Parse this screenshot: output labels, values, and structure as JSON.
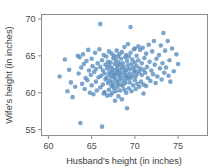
{
  "chart_data": {
    "type": "scatter",
    "title": "",
    "xlabel": "Husband's height (in inches)",
    "ylabel": "Wife's height (in inches)",
    "xlim": [
      59.2,
      78.4
    ],
    "ylim": [
      54.2,
      70.6
    ],
    "xticks": [
      60,
      65,
      70,
      75
    ],
    "yticks": [
      55,
      60,
      65,
      70
    ],
    "xticklabels": [
      "60",
      "65",
      "70",
      "75"
    ],
    "yticklabels": [
      "55",
      "60",
      "65",
      "70"
    ],
    "grid": false,
    "legend": null,
    "marker": {
      "color": "#5b8fbe",
      "opacity": 0.8,
      "size": 2.3,
      "shape": "circle"
    },
    "frame_color": "#8d8d8d",
    "background": "#ffffff",
    "n_points": 199,
    "points": [
      [
        61.3,
        62.2
      ],
      [
        61.9,
        64.5
      ],
      [
        62.2,
        60.2
      ],
      [
        62.4,
        63.1
      ],
      [
        62.6,
        61.4
      ],
      [
        62.8,
        59.4
      ],
      [
        63.1,
        60.8
      ],
      [
        63.4,
        65.0
      ],
      [
        63.5,
        62.6
      ],
      [
        63.6,
        64.8
      ],
      [
        63.7,
        55.9
      ],
      [
        63.8,
        63.4
      ],
      [
        63.9,
        61.2
      ],
      [
        64.0,
        65.2
      ],
      [
        64.1,
        63.9
      ],
      [
        64.2,
        60.5
      ],
      [
        64.3,
        62.0
      ],
      [
        64.4,
        64.3
      ],
      [
        64.5,
        61.7
      ],
      [
        64.6,
        65.8
      ],
      [
        64.7,
        63.0
      ],
      [
        64.8,
        60.0
      ],
      [
        64.9,
        62.4
      ],
      [
        65.0,
        64.6
      ],
      [
        65.0,
        61.0
      ],
      [
        65.1,
        63.6
      ],
      [
        65.2,
        59.8
      ],
      [
        65.3,
        62.8
      ],
      [
        65.4,
        65.4
      ],
      [
        65.5,
        61.5
      ],
      [
        65.5,
        63.2
      ],
      [
        65.6,
        60.3
      ],
      [
        65.7,
        64.0
      ],
      [
        65.8,
        62.1
      ],
      [
        65.9,
        65.9
      ],
      [
        66.0,
        69.3
      ],
      [
        66.0,
        63.5
      ],
      [
        66.0,
        60.7
      ],
      [
        66.1,
        62.3
      ],
      [
        66.2,
        55.4
      ],
      [
        66.2,
        64.4
      ],
      [
        66.3,
        61.1
      ],
      [
        66.3,
        63.0
      ],
      [
        66.4,
        59.9
      ],
      [
        66.4,
        65.1
      ],
      [
        66.5,
        62.6
      ],
      [
        66.5,
        60.1
      ],
      [
        66.6,
        63.8
      ],
      [
        66.6,
        61.8
      ],
      [
        66.7,
        64.9
      ],
      [
        66.7,
        62.0
      ],
      [
        66.8,
        59.6
      ],
      [
        66.8,
        63.3
      ],
      [
        66.9,
        61.3
      ],
      [
        66.9,
        64.2
      ],
      [
        67.0,
        62.5
      ],
      [
        67.0,
        60.4
      ],
      [
        67.0,
        63.7
      ],
      [
        67.0,
        65.6
      ],
      [
        67.1,
        61.6
      ],
      [
        67.1,
        62.9
      ],
      [
        67.2,
        59.7
      ],
      [
        67.2,
        64.1
      ],
      [
        67.2,
        62.2
      ],
      [
        67.3,
        60.9
      ],
      [
        67.3,
        63.4
      ],
      [
        67.3,
        65.3
      ],
      [
        67.4,
        61.4
      ],
      [
        67.4,
        62.7
      ],
      [
        67.4,
        60.0
      ],
      [
        67.5,
        64.7
      ],
      [
        67.5,
        62.1
      ],
      [
        67.5,
        63.1
      ],
      [
        67.5,
        61.0
      ],
      [
        67.6,
        65.0
      ],
      [
        67.6,
        62.4
      ],
      [
        67.6,
        60.6
      ],
      [
        67.7,
        63.9
      ],
      [
        67.7,
        61.9
      ],
      [
        67.7,
        58.9
      ],
      [
        67.8,
        62.6
      ],
      [
        67.8,
        64.4
      ],
      [
        67.8,
        60.2
      ],
      [
        67.9,
        63.2
      ],
      [
        67.9,
        61.5
      ],
      [
        67.9,
        65.7
      ],
      [
        68.0,
        62.8
      ],
      [
        68.0,
        60.8
      ],
      [
        68.0,
        63.6
      ],
      [
        68.0,
        64.9
      ],
      [
        68.0,
        61.2
      ],
      [
        68.1,
        62.3
      ],
      [
        68.1,
        59.5
      ],
      [
        68.1,
        64.1
      ],
      [
        68.2,
        63.0
      ],
      [
        68.2,
        61.7
      ],
      [
        68.2,
        65.2
      ],
      [
        68.3,
        62.5
      ],
      [
        68.3,
        60.3
      ],
      [
        68.3,
        63.8
      ],
      [
        68.4,
        61.1
      ],
      [
        68.4,
        64.6
      ],
      [
        68.4,
        62.0
      ],
      [
        68.5,
        63.3
      ],
      [
        68.5,
        59.1
      ],
      [
        68.5,
        65.5
      ],
      [
        68.6,
        62.7
      ],
      [
        68.6,
        60.9
      ],
      [
        68.6,
        64.0
      ],
      [
        68.7,
        61.6
      ],
      [
        68.7,
        63.5
      ],
      [
        68.8,
        62.2
      ],
      [
        68.8,
        66.2
      ],
      [
        68.8,
        60.4
      ],
      [
        68.9,
        64.8
      ],
      [
        68.9,
        62.9
      ],
      [
        68.9,
        61.3
      ],
      [
        69.0,
        63.1
      ],
      [
        69.0,
        65.1
      ],
      [
        69.0,
        60.0
      ],
      [
        69.0,
        62.4
      ],
      [
        69.1,
        64.3
      ],
      [
        69.1,
        61.9
      ],
      [
        69.1,
        57.9
      ],
      [
        69.2,
        63.7
      ],
      [
        69.2,
        62.1
      ],
      [
        69.2,
        66.6
      ],
      [
        69.3,
        60.6
      ],
      [
        69.3,
        64.9
      ],
      [
        69.4,
        62.6
      ],
      [
        69.4,
        63.2
      ],
      [
        69.4,
        61.4
      ],
      [
        69.5,
        65.4
      ],
      [
        69.5,
        62.0
      ],
      [
        69.5,
        68.9
      ],
      [
        69.6,
        63.9
      ],
      [
        69.6,
        60.2
      ],
      [
        69.7,
        64.5
      ],
      [
        69.7,
        62.3
      ],
      [
        69.8,
        61.0
      ],
      [
        69.8,
        63.4
      ],
      [
        69.9,
        65.9
      ],
      [
        69.9,
        62.8
      ],
      [
        70.0,
        64.1
      ],
      [
        70.0,
        61.7
      ],
      [
        70.0,
        63.0
      ],
      [
        70.0,
        66.0
      ],
      [
        70.1,
        62.2
      ],
      [
        70.1,
        60.5
      ],
      [
        70.2,
        65.0
      ],
      [
        70.2,
        63.6
      ],
      [
        70.3,
        61.2
      ],
      [
        70.3,
        62.6
      ],
      [
        70.4,
        66.3
      ],
      [
        70.4,
        64.4
      ],
      [
        70.5,
        62.9
      ],
      [
        70.5,
        60.8
      ],
      [
        70.6,
        63.3
      ],
      [
        70.6,
        65.8
      ],
      [
        70.7,
        61.5
      ],
      [
        70.8,
        62.4
      ],
      [
        70.8,
        64.0
      ],
      [
        70.9,
        66.1
      ],
      [
        71.0,
        63.1
      ],
      [
        71.0,
        61.1
      ],
      [
        71.1,
        64.7
      ],
      [
        71.2,
        62.7
      ],
      [
        71.3,
        65.3
      ],
      [
        71.3,
        60.9
      ],
      [
        71.4,
        63.5
      ],
      [
        71.5,
        62.0
      ],
      [
        71.6,
        66.5
      ],
      [
        71.7,
        64.2
      ],
      [
        71.8,
        61.6
      ],
      [
        71.9,
        63.0
      ],
      [
        72.0,
        65.6
      ],
      [
        72.1,
        62.5
      ],
      [
        72.2,
        67.0
      ],
      [
        72.3,
        63.8
      ],
      [
        72.4,
        61.3
      ],
      [
        72.5,
        64.6
      ],
      [
        72.6,
        62.2
      ],
      [
        72.8,
        65.1
      ],
      [
        72.9,
        63.3
      ],
      [
        73.0,
        66.4
      ],
      [
        73.1,
        61.8
      ],
      [
        73.2,
        64.0
      ],
      [
        73.3,
        68.1
      ],
      [
        73.4,
        62.7
      ],
      [
        73.5,
        65.7
      ],
      [
        73.6,
        63.4
      ],
      [
        73.8,
        67.0
      ],
      [
        74.0,
        64.4
      ],
      [
        74.1,
        61.5
      ],
      [
        74.3,
        66.0
      ],
      [
        74.5,
        62.9
      ],
      [
        74.8,
        65.2
      ],
      [
        75.0,
        63.9
      ],
      [
        73.9,
        62.3
      ],
      [
        71.0,
        59.9
      ]
    ]
  },
  "figure": {
    "width": 219,
    "height": 168
  }
}
